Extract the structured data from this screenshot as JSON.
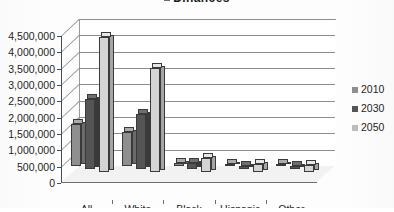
{
  "chart_data": {
    "type": "bar",
    "title": "Dinances",
    "title_cropped": true,
    "subtitle": "",
    "xlabel": "",
    "ylabel": "",
    "categories": [
      "All",
      "White",
      "Black",
      "Hispanic",
      "Other"
    ],
    "series": [
      {
        "name": "2010",
        "color": "#8f8f8f",
        "values": [
          1300000,
          1050000,
          100000,
          60000,
          50000
        ]
      },
      {
        "name": "2030",
        "color": "#555555",
        "values": [
          2150000,
          1700000,
          200000,
          110000,
          110000
        ]
      },
      {
        "name": "2050",
        "color": "#d4d4d4",
        "values": [
          4150000,
          3200000,
          430000,
          270000,
          230000
        ]
      }
    ],
    "ylim": [
      0,
      4500000
    ],
    "ytick_step": 500000,
    "yticks": [
      "0",
      "500,000",
      "1,000,000",
      "1,500,000",
      "2,000,000",
      "2,500,000",
      "3,000,000",
      "3,500,000",
      "4,000,000",
      "4,500,000"
    ],
    "grid": true,
    "grid_axis": "y",
    "legend": [
      "2010",
      "2030",
      "2050"
    ],
    "legend_position": "right",
    "three_d": true,
    "annotations": []
  },
  "legend": {
    "items": [
      {
        "label": "2010"
      },
      {
        "label": "2030"
      },
      {
        "label": "2050"
      }
    ]
  },
  "colors": {
    "series_2010": "#8f8f8f",
    "series_2030": "#555555",
    "series_2050": "#d4d4d4",
    "grid": "#8d8d8d",
    "axis": "#4d4d4d",
    "text": "#1f1f1f",
    "background": "#fdfdfd"
  }
}
